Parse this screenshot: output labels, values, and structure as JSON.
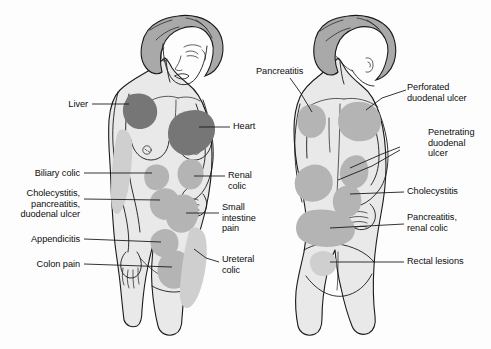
{
  "figure": {
    "views": [
      {
        "name": "anterior",
        "label": "Front view (anterior)"
      },
      {
        "name": "posterior",
        "label": "Back view (posterior)"
      }
    ]
  },
  "colors": {
    "body_fill": "#e9e9e9",
    "hair_fill": "#a9a9a9",
    "pain_dark": "#767676",
    "pain_mid": "#b4b4b4",
    "pain_light": "#cfcfcf",
    "outline": "#1a1a1a",
    "background": "#fdfdfd",
    "text": "#0d0d0d",
    "leader_line": "#111111"
  },
  "anterior_labels": [
    {
      "id": "liver",
      "text": "Liver",
      "align": "right",
      "x": 88,
      "y": 99,
      "leader": [
        [
          92,
          104
        ],
        [
          128,
          104
        ]
      ],
      "region": "right-upper-chest"
    },
    {
      "id": "biliary-colic",
      "text": "Biliary colic",
      "align": "right",
      "x": 80,
      "y": 168,
      "leader": [
        [
          84,
          173
        ],
        [
          150,
          173
        ]
      ],
      "region": "left-mid-chest-below-breast"
    },
    {
      "id": "cholecystitis-pancreatitis-duodenal-ulcer",
      "text": "Cholecystitis,\npancreatitis,\nduodenal ulcer",
      "align": "right",
      "x": 80,
      "y": 187,
      "leader": [
        [
          84,
          199
        ],
        [
          158,
          199
        ]
      ],
      "region": "left-upper-abdomen"
    },
    {
      "id": "appendicitis",
      "text": "Appendicitis",
      "align": "right",
      "x": 80,
      "y": 233,
      "leader": [
        [
          84,
          238
        ],
        [
          160,
          238
        ]
      ],
      "region": "mid-abdomen"
    },
    {
      "id": "colon-pain",
      "text": "Colon pain",
      "align": "right",
      "x": 80,
      "y": 258,
      "leader": [
        [
          84,
          263
        ],
        [
          170,
          263
        ]
      ],
      "region": "lower-abdomen"
    },
    {
      "id": "heart",
      "text": "Heart",
      "align": "left",
      "x": 233,
      "y": 121,
      "leader": [
        [
          200,
          126
        ],
        [
          230,
          126
        ]
      ],
      "region": "left-chest"
    },
    {
      "id": "renal-colic",
      "text": "Renal\ncolic",
      "align": "left",
      "x": 228,
      "y": 170,
      "leader": [
        [
          196,
          176
        ],
        [
          225,
          176
        ]
      ],
      "region": "right-flank"
    },
    {
      "id": "small-intestine-pain",
      "text": "Small\nintestine\npain",
      "align": "left",
      "x": 222,
      "y": 203,
      "leader": [
        [
          186,
          213
        ],
        [
          219,
          213
        ]
      ],
      "region": "periumbilical"
    },
    {
      "id": "ureteral-colic",
      "text": "Ureteral\ncolic",
      "align": "left",
      "x": 222,
      "y": 254,
      "leader": [
        [
          190,
          262
        ],
        [
          219,
          262
        ]
      ],
      "region": "right-groin"
    }
  ],
  "posterior_labels": [
    {
      "id": "pancreatitis-back",
      "text": "Pancreatitis",
      "align": "left",
      "x": 256,
      "y": 67,
      "leader": [
        [
          290,
          78
        ],
        [
          312,
          108
        ]
      ],
      "region": "left-shoulder-blade"
    },
    {
      "id": "perforated-duodenal-ulcer",
      "text": "Perforated\nduodenal ulcer",
      "align": "left",
      "x": 408,
      "y": 82,
      "leader": [
        [
          368,
          104
        ],
        [
          404,
          94
        ]
      ],
      "region": "right-shoulder-blade"
    },
    {
      "id": "penetrating-duodenal-ulcer",
      "text": "Penetrating\nduodenal\nulcer",
      "align": "left",
      "x": 430,
      "y": 128,
      "leader": [
        [
          330,
          168
        ],
        [
          426,
          140
        ]
      ],
      "region": "mid-back"
    },
    {
      "id": "cholecystitis-back",
      "text": "Cholecystitis",
      "align": "left",
      "x": 408,
      "y": 186,
      "leader": [
        [
          346,
          192
        ],
        [
          404,
          192
        ]
      ],
      "region": "right-subscapular"
    },
    {
      "id": "pancreatitis-renal-colic",
      "text": "Pancreatitis,\nrenal colic",
      "align": "left",
      "x": 408,
      "y": 213,
      "leader": [
        [
          358,
          223
        ],
        [
          404,
          223
        ]
      ],
      "region": "lower-back"
    },
    {
      "id": "rectal-lesions",
      "text": "Rectal lesions",
      "align": "left",
      "x": 408,
      "y": 256,
      "leader": [
        [
          350,
          261
        ],
        [
          404,
          261
        ]
      ],
      "region": "sacral"
    }
  ]
}
